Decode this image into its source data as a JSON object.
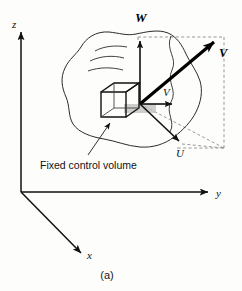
{
  "figure": {
    "caption": "(a)",
    "annotation_label": "Fixed control volume",
    "background_color": "#fdfdfc",
    "ink_color": "#111111",
    "dashed_color": "#8d8d8d"
  },
  "axes": [
    {
      "id": "z",
      "label": "z",
      "description": "vertical axis pointing up"
    },
    {
      "id": "y",
      "label": "y",
      "description": "horizontal axis pointing right"
    },
    {
      "id": "x",
      "label": "x",
      "description": "oblique axis pointing down-right toward viewer"
    }
  ],
  "vectors": [
    {
      "id": "V-resultant",
      "label": "V",
      "style": "bold",
      "description": "resultant velocity vector pointing up-right"
    },
    {
      "id": "W-component",
      "label": "W",
      "style": "italic",
      "description": "vertical velocity component along z"
    },
    {
      "id": "V-component",
      "label": "V",
      "style": "italic",
      "description": "horizontal velocity component along y"
    },
    {
      "id": "U-component",
      "label": "U",
      "style": "italic",
      "description": "velocity component along x, pointing down-right"
    }
  ],
  "control_volume": {
    "name": "Fixed control volume",
    "shape": "small cube at the center of the flow region"
  },
  "flow_region": {
    "name": "flow field blob",
    "streamline_count": 3
  }
}
